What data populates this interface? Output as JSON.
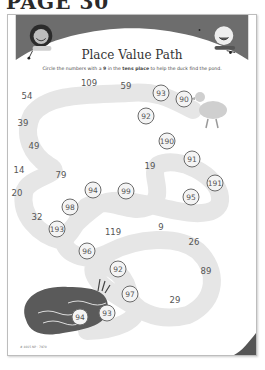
{
  "page": {
    "label": "PAGE 30"
  },
  "worksheet": {
    "title": "Place Value Path",
    "instructions": {
      "before": "Circle the numbers with a ",
      "digit": "9",
      "middle": " in the ",
      "emphasis": "tens place",
      "after": " to help the duck find the pond."
    },
    "colors": {
      "banner": "#6d6d6d",
      "path": "#e6e6e6",
      "circle_border": "#6a6a6a",
      "pond": "#5a5a5a"
    },
    "path_numbers": [
      {
        "value": "54",
        "circled": false,
        "x": 26,
        "y": 95
      },
      {
        "value": "109",
        "circled": false,
        "x": 88,
        "y": 82
      },
      {
        "value": "59",
        "circled": false,
        "x": 125,
        "y": 85
      },
      {
        "value": "93",
        "circled": true,
        "x": 160,
        "y": 92
      },
      {
        "value": "90",
        "circled": true,
        "x": 183,
        "y": 98
      },
      {
        "value": "39",
        "circled": false,
        "x": 22,
        "y": 122
      },
      {
        "value": "92",
        "circled": true,
        "x": 145,
        "y": 115
      },
      {
        "value": "49",
        "circled": false,
        "x": 33,
        "y": 145
      },
      {
        "value": "190",
        "circled": true,
        "x": 166,
        "y": 140
      },
      {
        "value": "14",
        "circled": false,
        "x": 18,
        "y": 169
      },
      {
        "value": "79",
        "circled": false,
        "x": 60,
        "y": 174
      },
      {
        "value": "19",
        "circled": false,
        "x": 149,
        "y": 165
      },
      {
        "value": "91",
        "circled": true,
        "x": 191,
        "y": 158
      },
      {
        "value": "20",
        "circled": false,
        "x": 16,
        "y": 192
      },
      {
        "value": "94",
        "circled": true,
        "x": 92,
        "y": 189
      },
      {
        "value": "99",
        "circled": true,
        "x": 125,
        "y": 190
      },
      {
        "value": "191",
        "circled": true,
        "x": 214,
        "y": 182
      },
      {
        "value": "95",
        "circled": true,
        "x": 190,
        "y": 196
      },
      {
        "value": "98",
        "circled": true,
        "x": 69,
        "y": 206
      },
      {
        "value": "32",
        "circled": false,
        "x": 36,
        "y": 216
      },
      {
        "value": "193",
        "circled": true,
        "x": 56,
        "y": 228
      },
      {
        "value": "119",
        "circled": false,
        "x": 112,
        "y": 231
      },
      {
        "value": "9",
        "circled": false,
        "x": 160,
        "y": 226
      },
      {
        "value": "96",
        "circled": true,
        "x": 86,
        "y": 250
      },
      {
        "value": "26",
        "circled": false,
        "x": 193,
        "y": 241
      },
      {
        "value": "92",
        "circled": true,
        "x": 117,
        "y": 268
      },
      {
        "value": "89",
        "circled": false,
        "x": 205,
        "y": 270
      },
      {
        "value": "97",
        "circled": true,
        "x": 129,
        "y": 293
      },
      {
        "value": "29",
        "circled": false,
        "x": 174,
        "y": 299
      },
      {
        "value": "93",
        "circled": true,
        "x": 106,
        "y": 312
      },
      {
        "value": "94",
        "circled": true,
        "x": 79,
        "y": 316
      }
    ],
    "footer": {
      "code": "# 4015 NP · 7970",
      "page_number": "31"
    }
  }
}
